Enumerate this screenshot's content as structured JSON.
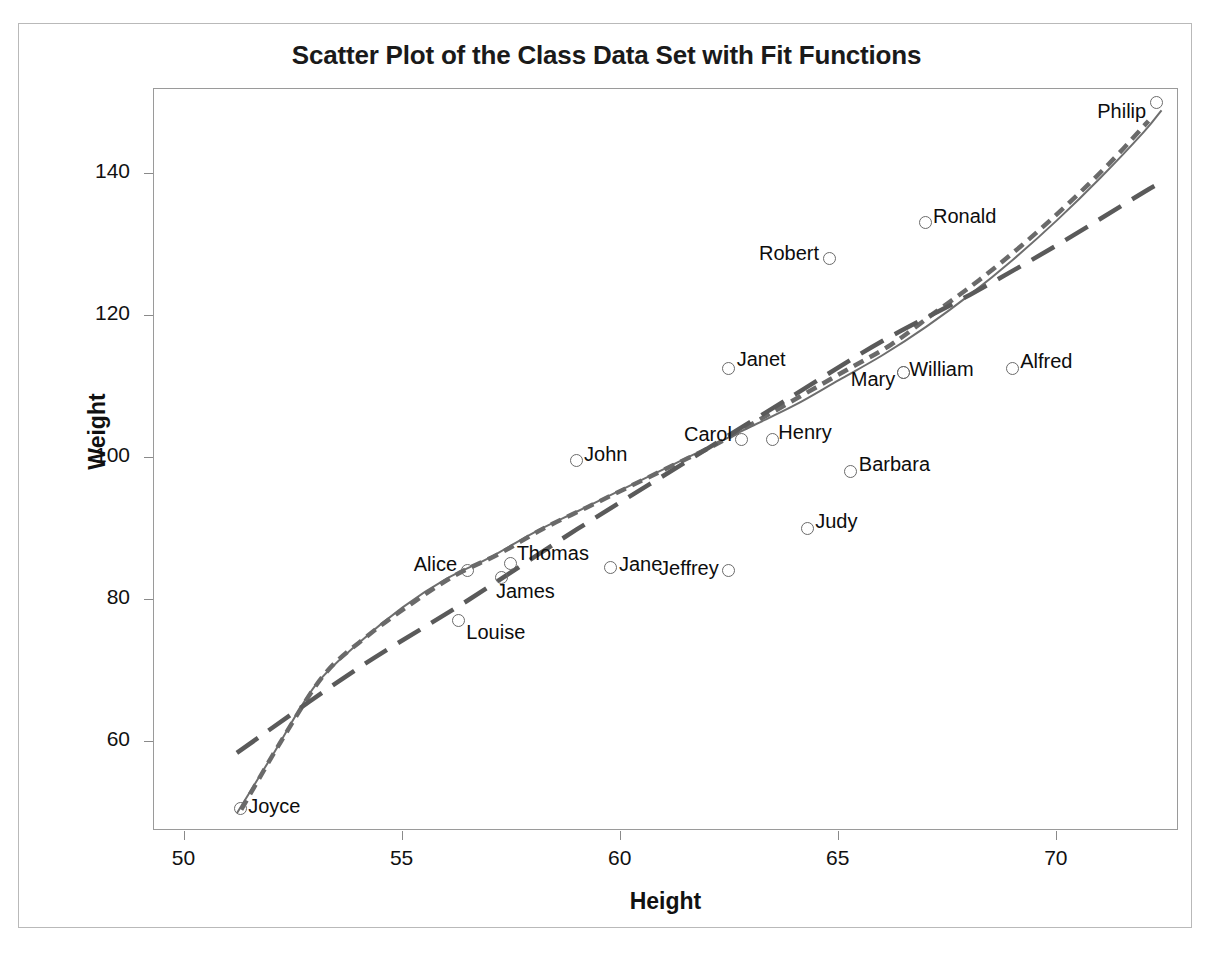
{
  "chart_data": {
    "type": "scatter",
    "title": "Scatter Plot of the Class Data Set with Fit Functions",
    "xlabel": "Height",
    "ylabel": "Weight",
    "xlim": [
      49.3,
      72.8
    ],
    "ylim": [
      47.5,
      152.0
    ],
    "xticks": [
      50,
      55,
      60,
      65,
      70
    ],
    "yticks": [
      60,
      80,
      100,
      120,
      140
    ],
    "xtick_labels": [
      "50",
      "55",
      "60",
      "65",
      "70"
    ],
    "ytick_labels": [
      "60",
      "80",
      "100",
      "120",
      "140"
    ],
    "grid": false,
    "legend": "none",
    "marker": "open-circle",
    "point_label_field": "name",
    "points": [
      {
        "name": "Joyce",
        "x": 51.3,
        "y": 50.5,
        "label_dx": 8,
        "label_dy": -2,
        "anchor": "left"
      },
      {
        "name": "Alice",
        "x": 56.5,
        "y": 84.0,
        "label_dx": -10,
        "label_dy": -6,
        "anchor": "right"
      },
      {
        "name": "Thomas",
        "x": 57.5,
        "y": 85.0,
        "label_dx": 6,
        "label_dy": -10,
        "anchor": "left"
      },
      {
        "name": "James",
        "x": 57.3,
        "y": 83.0,
        "label_dx": -6,
        "label_dy": 14,
        "anchor": "left"
      },
      {
        "name": "Louise",
        "x": 56.3,
        "y": 77.0,
        "label_dx": 8,
        "label_dy": 12,
        "anchor": "left"
      },
      {
        "name": "John",
        "x": 59.0,
        "y": 99.5,
        "label_dx": 8,
        "label_dy": -6,
        "anchor": "left"
      },
      {
        "name": "Jane",
        "x": 59.8,
        "y": 84.5,
        "label_dx": 8,
        "label_dy": -2,
        "anchor": "left"
      },
      {
        "name": "Jeffrey",
        "x": 62.5,
        "y": 84.0,
        "label_dx": -10,
        "label_dy": -2,
        "anchor": "right"
      },
      {
        "name": "Janet",
        "x": 62.5,
        "y": 112.5,
        "label_dx": 8,
        "label_dy": -8,
        "anchor": "left"
      },
      {
        "name": "Carol",
        "x": 62.8,
        "y": 102.5,
        "label_dx": -10,
        "label_dy": -4,
        "anchor": "right"
      },
      {
        "name": "Henry",
        "x": 63.5,
        "y": 102.5,
        "label_dx": 6,
        "label_dy": -6,
        "anchor": "left"
      },
      {
        "name": "Judy",
        "x": 64.3,
        "y": 90.0,
        "label_dx": 8,
        "label_dy": -6,
        "anchor": "left"
      },
      {
        "name": "Robert",
        "x": 64.8,
        "y": 128.0,
        "label_dx": -10,
        "label_dy": -4,
        "anchor": "right"
      },
      {
        "name": "Barbara",
        "x": 65.3,
        "y": 98.0,
        "label_dx": 8,
        "label_dy": -6,
        "anchor": "left"
      },
      {
        "name": "Mary",
        "x": 66.5,
        "y": 112.0,
        "label_dx": -8,
        "label_dy": 8,
        "anchor": "right"
      },
      {
        "name": "William",
        "x": 66.5,
        "y": 112.0,
        "label_dx": 6,
        "label_dy": -2,
        "anchor": "left"
      },
      {
        "name": "Ronald",
        "x": 67.0,
        "y": 133.0,
        "label_dx": 8,
        "label_dy": -6,
        "anchor": "left"
      },
      {
        "name": "Alfred",
        "x": 69.0,
        "y": 112.5,
        "label_dx": 8,
        "label_dy": -6,
        "anchor": "left"
      },
      {
        "name": "Philip",
        "x": 72.3,
        "y": 150.0,
        "label_dx": -10,
        "label_dy": 10,
        "anchor": "right"
      }
    ],
    "fits": [
      {
        "name": "loess-fit",
        "style": "solid",
        "color": "#6e6e6e",
        "points": [
          [
            51.2,
            50.0
          ],
          [
            52.0,
            58.0
          ],
          [
            53.0,
            68.0
          ],
          [
            54.0,
            74.0
          ],
          [
            55.0,
            79.0
          ],
          [
            56.0,
            83.0
          ],
          [
            57.0,
            86.0
          ],
          [
            58.0,
            89.5
          ],
          [
            59.0,
            92.5
          ],
          [
            60.0,
            95.5
          ],
          [
            61.0,
            98.5
          ],
          [
            62.0,
            101.5
          ],
          [
            63.0,
            104.5
          ],
          [
            64.0,
            107.5
          ],
          [
            65.0,
            111.0
          ],
          [
            66.0,
            114.5
          ],
          [
            67.0,
            118.5
          ],
          [
            68.0,
            123.0
          ],
          [
            69.0,
            128.0
          ],
          [
            70.0,
            133.5
          ],
          [
            71.0,
            139.5
          ],
          [
            72.0,
            146.0
          ],
          [
            72.4,
            149.0
          ]
        ]
      },
      {
        "name": "spline-fit",
        "style": "short-dash",
        "color": "#6a6a6a",
        "points": [
          [
            51.3,
            50.5
          ],
          [
            52.2,
            60.0
          ],
          [
            53.2,
            69.5
          ],
          [
            54.2,
            75.0
          ],
          [
            55.2,
            79.5
          ],
          [
            56.2,
            83.5
          ],
          [
            57.2,
            86.5
          ],
          [
            58.2,
            90.0
          ],
          [
            59.2,
            93.0
          ],
          [
            60.2,
            96.0
          ],
          [
            61.2,
            99.0
          ],
          [
            62.2,
            102.0
          ],
          [
            63.2,
            105.5
          ],
          [
            64.2,
            109.0
          ],
          [
            65.2,
            112.5
          ],
          [
            66.2,
            116.0
          ],
          [
            67.2,
            120.5
          ],
          [
            68.2,
            125.0
          ],
          [
            69.2,
            130.0
          ],
          [
            70.2,
            135.5
          ],
          [
            71.2,
            141.5
          ],
          [
            72.1,
            147.5
          ]
        ]
      },
      {
        "name": "regression-fit",
        "style": "long-dash",
        "color": "#5a5a5a",
        "points": [
          [
            51.2,
            58.5
          ],
          [
            54.0,
            70.5
          ],
          [
            56.5,
            80.0
          ],
          [
            59.0,
            90.0
          ],
          [
            61.5,
            99.5
          ],
          [
            64.0,
            109.0
          ],
          [
            66.0,
            116.5
          ],
          [
            68.0,
            123.0
          ],
          [
            70.0,
            130.0
          ],
          [
            72.0,
            137.5
          ],
          [
            72.4,
            138.8
          ]
        ]
      }
    ]
  }
}
